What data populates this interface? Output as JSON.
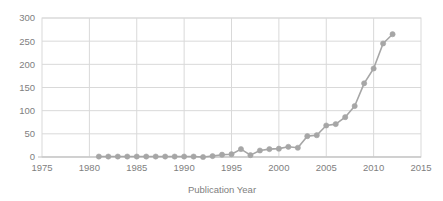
{
  "chart_data": {
    "type": "line",
    "title": "",
    "subtitle": "",
    "xlabel": "Publication Year",
    "ylabel": "",
    "xlim": [
      1975,
      2015
    ],
    "ylim": [
      0,
      300
    ],
    "xticks": [
      1975,
      1980,
      1985,
      1990,
      1995,
      2000,
      2005,
      2010,
      2015
    ],
    "yticks": [
      0,
      50,
      100,
      150,
      200,
      250,
      300
    ],
    "xtick_labels": [
      "1975",
      "1980",
      "1985",
      "1990",
      "1995",
      "2000",
      "2005",
      "2010",
      "2015"
    ],
    "ytick_labels": [
      "0",
      "50",
      "100",
      "150",
      "200",
      "250",
      "300"
    ],
    "grid": true,
    "grid_axis": "both",
    "legend": false,
    "legend_position": "none",
    "markers": "circle",
    "series": [
      {
        "name": "Publications",
        "color": "#a6a6a6",
        "x": [
          1981,
          1982,
          1983,
          1984,
          1985,
          1986,
          1987,
          1988,
          1989,
          1990,
          1991,
          1992,
          1993,
          1994,
          1995,
          1996,
          1997,
          1998,
          1999,
          2000,
          2001,
          2002,
          2003,
          2004,
          2005,
          2006,
          2007,
          2008,
          2009,
          2010,
          2011,
          2012
        ],
        "values": [
          1,
          1,
          1,
          1,
          1,
          1,
          1,
          1,
          1,
          1,
          1,
          0,
          2,
          5,
          6,
          17,
          4,
          14,
          17,
          18,
          22,
          20,
          45,
          47,
          68,
          71,
          86,
          110,
          159,
          191,
          245,
          265
        ]
      }
    ]
  },
  "colors": {
    "series": "#a6a6a6",
    "grid": "#d9d9d9",
    "axis_text": "#808080",
    "background": "#ffffff"
  }
}
